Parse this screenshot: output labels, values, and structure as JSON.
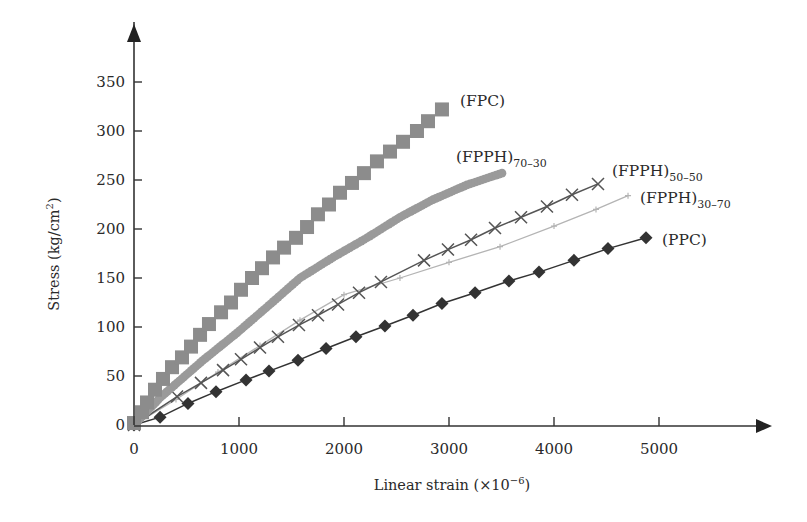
{
  "chart_data": {
    "type": "line",
    "title": "",
    "xlabel": "Linear strain (×10⁻⁶)",
    "xlabel_parts": {
      "main": "Linear strain (×10",
      "sup": "−6",
      "close": ")"
    },
    "ylabel": "Stress (kg/cm²)",
    "ylabel_parts": {
      "main": "Stress (kg/cm",
      "sup": "2",
      "close": ")"
    },
    "xlim": [
      0,
      6000
    ],
    "ylim": [
      0,
      380
    ],
    "x_ticks": [
      0,
      1000,
      2000,
      3000,
      4000,
      5000
    ],
    "y_ticks": [
      0,
      50,
      100,
      150,
      200,
      250,
      300,
      350
    ],
    "grid": false,
    "legend": "inline labels at curve ends",
    "series": [
      {
        "name": "(FPC)",
        "label_main": "(FPC)",
        "label_sub": "",
        "marker": "square",
        "color": "#8c8c8c",
        "line": false,
        "x": [
          0,
          76,
          124,
          200,
          276,
          362,
          457,
          543,
          629,
          714,
          829,
          924,
          1019,
          1124,
          1219,
          1324,
          1429,
          1543,
          1648,
          1752,
          1857,
          1962,
          2076,
          2190,
          2314,
          2438,
          2562,
          2695,
          2800,
          2933
        ],
        "y": [
          2,
          13,
          23,
          36,
          47,
          59,
          69,
          80,
          92,
          103,
          115,
          125,
          138,
          150,
          160,
          171,
          181,
          191,
          202,
          215,
          225,
          237,
          247,
          257,
          269,
          279,
          289,
          300,
          310,
          322
        ]
      },
      {
        "name": "(FPPH)70-30",
        "label_main": "(FPPH)",
        "label_sub": "70–30",
        "marker": "circle-dense",
        "color": "#9a9a9a",
        "line": false,
        "x": [
          0,
          250,
          657,
          981,
          1305,
          1581,
          1895,
          2219,
          2533,
          2848,
          3171,
          3505
        ],
        "y": [
          0,
          28,
          66,
          94,
          124,
          150,
          171,
          191,
          212,
          230,
          245,
          257
        ]
      },
      {
        "name": "(FPPH)50-50",
        "label_main": "(FPPH)",
        "label_sub": "50–50",
        "marker": "x",
        "color": "#555555",
        "line": true,
        "x": [
          0,
          410,
          638,
          848,
          1019,
          1200,
          1371,
          1571,
          1752,
          1943,
          2143,
          2352,
          2762,
          2990,
          3210,
          3438,
          3686,
          3933,
          4171,
          4419
        ],
        "y": [
          0,
          29,
          43,
          56,
          67,
          79,
          90,
          102,
          112,
          123,
          135,
          146,
          168,
          179,
          189,
          201,
          212,
          223,
          235,
          246
        ]
      },
      {
        "name": "(FPPH)30-70",
        "label_main": "(FPPH)",
        "label_sub": "30–70",
        "marker": "plus-small",
        "color": "#b4b4b4",
        "line": true,
        "x": [
          0,
          400,
          800,
          1200,
          1581,
          2000,
          2533,
          3000,
          3486,
          4000,
          4400,
          4705
        ],
        "y": [
          0,
          26,
          54,
          81,
          107,
          133,
          150,
          166,
          182,
          203,
          220,
          234
        ]
      },
      {
        "name": "(PPC)",
        "label_main": "(PPC)",
        "label_sub": "",
        "marker": "diamond",
        "color": "#333333",
        "line": true,
        "x": [
          0,
          248,
          514,
          781,
          1067,
          1286,
          1562,
          1829,
          2114,
          2390,
          2657,
          2933,
          3248,
          3571,
          3857,
          4190,
          4514,
          4876
        ],
        "y": [
          0,
          8,
          22,
          34,
          46,
          55,
          66,
          78,
          90,
          101,
          112,
          124,
          135,
          147,
          156,
          168,
          180,
          191
        ]
      }
    ]
  }
}
